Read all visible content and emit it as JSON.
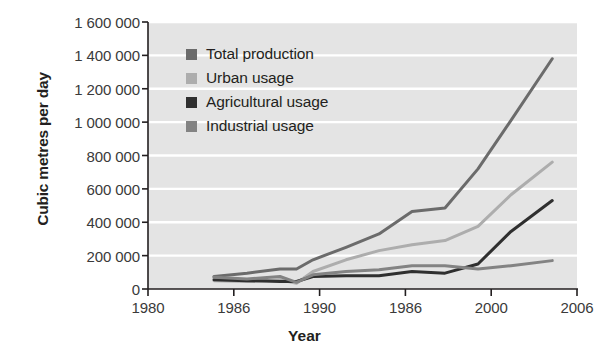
{
  "chart_data": {
    "type": "line",
    "title": "",
    "xlabel": "Year",
    "ylabel": "Cubic metres per day",
    "xlim": [
      1980,
      2006
    ],
    "ylim": [
      0,
      1600000
    ],
    "xticks": [
      1980,
      1986,
      1990,
      1986,
      2000,
      2006
    ],
    "xtick_labels": [
      "1980",
      "1986",
      "1990",
      "1986",
      "2000",
      "2006"
    ],
    "yticks": [
      0,
      200000,
      400000,
      600000,
      800000,
      1000000,
      1200000,
      1400000,
      1600000
    ],
    "ytick_labels": [
      "0",
      "200 000",
      "400 000",
      "600 000",
      "800 000",
      "1 000 000",
      "1 200 000",
      "1 400 000",
      "1 600 000"
    ],
    "grid": "horizontal",
    "grid_color": "#ffffff",
    "plot_background": "#e4e4e4",
    "legend_position": "upper left",
    "series": [
      {
        "name": "Total production",
        "color": "#6b6b6b",
        "x": [
          1984,
          1986,
          1988,
          1989,
          1990,
          1992,
          1994,
          1996,
          1998,
          2000,
          2002,
          2004.5
        ],
        "values": [
          75000,
          95000,
          120000,
          120000,
          175000,
          250000,
          330000,
          465000,
          485000,
          720000,
          1010000,
          1380000
        ]
      },
      {
        "name": "Urban usage",
        "color": "#adadad",
        "x": [
          1984,
          1986,
          1988,
          1989,
          1990,
          1992,
          1994,
          1996,
          1998,
          2000,
          2002,
          2004.5
        ],
        "values": [
          50000,
          45000,
          55000,
          35000,
          105000,
          175000,
          230000,
          265000,
          290000,
          375000,
          565000,
          760000
        ]
      },
      {
        "name": "Agricultural usage",
        "color": "#2f2f2f",
        "x": [
          1984,
          1986,
          1988,
          1989,
          1990,
          1992,
          1994,
          1996,
          1998,
          2000,
          2002,
          2004.5
        ],
        "values": [
          55000,
          50000,
          45000,
          45000,
          75000,
          80000,
          80000,
          105000,
          95000,
          150000,
          345000,
          530000
        ]
      },
      {
        "name": "Industrial usage",
        "color": "#838383",
        "x": [
          1984,
          1986,
          1988,
          1989,
          1990,
          1992,
          1994,
          1996,
          1998,
          2000,
          2002,
          2004.5
        ],
        "values": [
          70000,
          60000,
          75000,
          40000,
          85000,
          105000,
          115000,
          140000,
          140000,
          120000,
          140000,
          170000
        ]
      }
    ]
  },
  "legend": {
    "items": [
      {
        "label": "Total production",
        "color": "#6b6b6b"
      },
      {
        "label": "Urban usage",
        "color": "#adadad"
      },
      {
        "label": "Agricultural usage",
        "color": "#2f2f2f"
      },
      {
        "label": "Industrial usage",
        "color": "#838383"
      }
    ]
  },
  "axis": {
    "x_title": "Year",
    "y_title": "Cubic metres per day"
  }
}
